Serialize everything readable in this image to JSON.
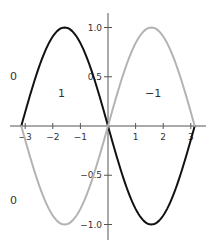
{
  "chart_data": {
    "type": "line",
    "title": "",
    "xlabel": "",
    "ylabel": "",
    "xlim": [
      -3.5,
      3.5
    ],
    "ylim": [
      -1.15,
      1.15
    ],
    "grid": false,
    "legend": "none",
    "x_ticks": [
      -3,
      -2,
      -1,
      1,
      2,
      3
    ],
    "x_tick_labels": [
      "−3",
      "−2",
      "−1",
      "1",
      "2",
      "3"
    ],
    "y_ticks": [
      1.0,
      0.5,
      -0.5,
      -1.0
    ],
    "y_tick_labels": [
      "1.0",
      "0.5",
      "−0.5",
      "−1.0"
    ],
    "series": [
      {
        "name": "-sin(x)",
        "color": "#111111",
        "stroke_width": 2,
        "x": [
          -3.1416,
          -2.3562,
          -1.5708,
          -0.7854,
          0,
          0.7854,
          1.5708,
          2.3562,
          3.1416
        ],
        "values": [
          0,
          0.7071,
          1,
          0.7071,
          0,
          -0.7071,
          -1,
          -0.7071,
          0
        ],
        "function": "neg_sin"
      },
      {
        "name": "sin(x)",
        "color": "#b3b3b3",
        "stroke_width": 2,
        "x": [
          -3.1416,
          -2.3562,
          -1.5708,
          -0.7854,
          0,
          0.7854,
          1.5708,
          2.3562,
          3.1416
        ],
        "values": [
          0,
          -0.7071,
          -1,
          -0.7071,
          0,
          0.7071,
          1,
          0.7071,
          0
        ],
        "function": "sin"
      }
    ],
    "annotations": [
      {
        "text": "0",
        "x": -3.4,
        "y": 0.5
      },
      {
        "text": "1",
        "x": -1.7,
        "y": 0.33
      },
      {
        "text": "−1",
        "x": 1.6,
        "y": 0.33
      },
      {
        "text": "0",
        "x": -3.4,
        "y": -0.75
      }
    ]
  },
  "layout": {
    "origin_px": [
      108,
      126
    ],
    "x_unit_px": 27.6,
    "y_unit_px": 98.5,
    "x_axis_span_px": [
      10,
      206
    ],
    "y_axis_span_px": [
      13,
      240
    ],
    "axis_color": "#555555"
  },
  "annotations_px": [
    {
      "text": "0",
      "x": 10,
      "y": 80
    },
    {
      "text": "1",
      "x": 58,
      "y": 97
    },
    {
      "text": "−1",
      "x": 145,
      "y": 97
    },
    {
      "text": "0",
      "x": 10,
      "y": 204
    }
  ]
}
